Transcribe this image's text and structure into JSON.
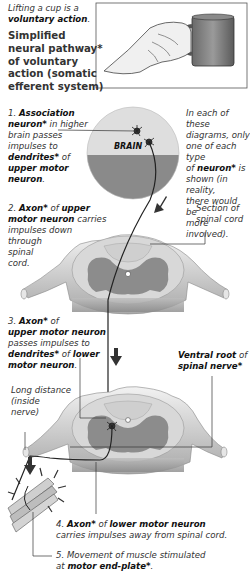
{
  "intro": {
    "line1": "Lifting a cup is a",
    "line2_bold": "voluntary action",
    "line2_end": "."
  },
  "title": {
    "lines": [
      "Simplified",
      "neural pathway*",
      "of voluntary",
      "action (somatic",
      "efferent system)"
    ]
  },
  "brain_label": "BRAIN",
  "note": {
    "lines": [
      "In each of these",
      "diagrams, only",
      "one of each type"
    ],
    "line4_pre": "of ",
    "line4_bold": "neuron*",
    "line4_post": " is",
    "lines_rest": [
      "shown (in reality,",
      "there would be",
      "more involved)."
    ]
  },
  "steps": [
    {
      "num": "1.",
      "bold1": "Association",
      "bold1b": "neuron*",
      "text1": " in higher",
      "text2": "brain passes",
      "text3": "impulses to",
      "bold2": "dendrites*",
      "text4": " of",
      "bold3": "upper motor",
      "bold4": "neuron",
      "end": "."
    },
    {
      "num": "2.",
      "bold1": "Axon*",
      "text1": " of ",
      "bold2": "upper",
      "bold3": "motor neuron",
      "text2": " carries",
      "lines": [
        "impulses down",
        "through",
        "spinal",
        "cord."
      ]
    },
    {
      "num": "3.",
      "bold1": "Axon*",
      "text1": " of",
      "bold2": "upper motor neuron",
      "text2": "passes impulses to",
      "bold3": "dendrites*",
      "text3": " of ",
      "bold4": "lower",
      "bold5": "motor neuron",
      "end": "."
    },
    {
      "num": "4.",
      "bold1": "Axon*",
      "text1": " of ",
      "bold2": "lower motor neuron",
      "text2": "carries impulses away from spinal cord."
    },
    {
      "num": "5.",
      "text1": "Movement of muscle stimulated",
      "text2": "at ",
      "bold1": "motor end-plate*",
      "end": "."
    }
  ],
  "labels": {
    "section": [
      "Section of",
      "spinal cord"
    ],
    "ventral_bold": "Ventral root",
    "ventral_text": " of",
    "ventral_bold2": "spinal nerve*",
    "long_distance": [
      "Long distance",
      "(inside",
      "nerve)"
    ]
  },
  "colors": {
    "brain_upper": "#dedede",
    "brain_lower": "#8a8a8a",
    "grey_matter": "#8c8c8c",
    "white_matter": "#d8d8d8",
    "arrow": "#333333",
    "pathway": "#222222"
  }
}
